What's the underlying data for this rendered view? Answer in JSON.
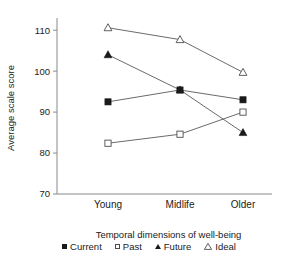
{
  "chart_data": {
    "type": "line",
    "title": "",
    "xlabel": "Temporal dimensions of well-being",
    "ylabel": "Average scale score",
    "categories": [
      "Young",
      "Midlife",
      "Older"
    ],
    "yticks": [
      70,
      80,
      90,
      100,
      110
    ],
    "ylim": [
      70,
      112
    ],
    "grid": false,
    "legend_position": "bottom",
    "series": [
      {
        "name": "Current",
        "marker": "filled-square",
        "values": [
          92.5,
          95.4,
          93.0
        ]
      },
      {
        "name": "Past",
        "marker": "open-square",
        "values": [
          82.4,
          84.6,
          90.0
        ]
      },
      {
        "name": "Future",
        "marker": "filled-triangle",
        "values": [
          104.0,
          95.4,
          85.0
        ]
      },
      {
        "name": "Ideal",
        "marker": "open-triangle",
        "values": [
          110.6,
          107.7,
          99.7
        ]
      }
    ]
  },
  "axis": {
    "y_title": "Average scale score",
    "x_title": "Temporal dimensions of well-being",
    "y_tick_labels": [
      "110",
      "100",
      "90",
      "80",
      "70"
    ],
    "x_tick_labels": [
      "Young",
      "Midlife",
      "Older"
    ]
  },
  "legend": {
    "items": [
      {
        "label": "Current",
        "marker": "filled-square"
      },
      {
        "label": "Past",
        "marker": "open-square"
      },
      {
        "label": "Future",
        "marker": "filled-triangle"
      },
      {
        "label": "Ideal",
        "marker": "open-triangle"
      }
    ]
  },
  "caption": {
    "partial_text": ""
  },
  "colors": {
    "marker_dark": "#1a1a1a",
    "line": "#595959",
    "axis": "#8a8a8a",
    "background": "#ffffff"
  }
}
